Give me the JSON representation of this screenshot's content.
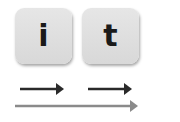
{
  "tiles": [
    {
      "label": "i"
    },
    {
      "label": "t"
    }
  ],
  "arrows": {
    "dark_color": "#2a2a2a",
    "light_color": "#8a8a8a"
  }
}
